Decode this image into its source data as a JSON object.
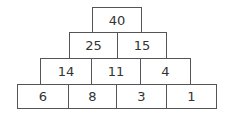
{
  "pyramid": {
    "rows": [
      [
        "40"
      ],
      [
        "25",
        "15"
      ],
      [
        "14",
        "11",
        "4"
      ],
      [
        "6",
        "8",
        "3",
        "1"
      ]
    ]
  }
}
